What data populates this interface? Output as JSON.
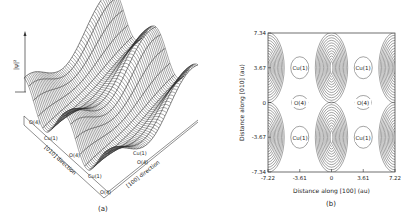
{
  "chart_data": [
    {
      "panel": "a",
      "type": "surface3d",
      "caption": "(a)",
      "zlabel": "|ψ|²",
      "axis_labels": {
        "left_axis": "[010] direction",
        "right_axis": "[100] direction"
      },
      "left_axis_sites": [
        "O(4)",
        "Cu(1)",
        "O(4)",
        "Cu(1)",
        "O(4)"
      ],
      "right_axis_sites": [
        "Cu(1)",
        "O(4)"
      ],
      "description": "Wireframe surface of |ψ|² over the CuO chain plane; ridges along [010] with peaks between Cu(1) sites"
    },
    {
      "panel": "b",
      "type": "contour",
      "caption": "(b)",
      "xlabel": "Distance along [100] (au)",
      "ylabel": "Distance along [010] (au)",
      "xticks": [
        "-7.22",
        "-3.61",
        "0",
        "3.61",
        "7.22"
      ],
      "yticks": [
        "7.34",
        "3.67",
        "0",
        "-3.67",
        "-7.34"
      ],
      "xlim": [
        -7.22,
        7.22
      ],
      "ylim": [
        -7.34,
        7.34
      ],
      "site_labels": [
        {
          "label": "Cu(1)",
          "x": -3.61,
          "y": 3.67
        },
        {
          "label": "Cu(1)",
          "x": 3.61,
          "y": 3.67
        },
        {
          "label": "O(4)",
          "x": -3.61,
          "y": 0
        },
        {
          "label": "O(4)",
          "x": 3.61,
          "y": 0
        },
        {
          "label": "Cu(1)",
          "x": -3.61,
          "y": -3.67
        },
        {
          "label": "Cu(1)",
          "x": 3.61,
          "y": -3.67
        }
      ],
      "maxima_centers": [
        {
          "x": 0,
          "y": 3.67
        },
        {
          "x": 0,
          "y": -3.67
        }
      ],
      "grid": false
    }
  ],
  "panel_a": {
    "zlabel": "|ψ|²",
    "caption": "(a)",
    "dir010": "[010] direction",
    "dir100": "[100] direction",
    "sites_left": [
      "O(4)",
      "Cu(1)",
      "O(4)",
      "Cu(1)",
      "O(4)"
    ],
    "sites_right": [
      "Cu(1)",
      "O(4)"
    ]
  },
  "panel_b": {
    "caption": "(b)",
    "xlabel": "Distance along [100] (au)",
    "ylabel": "Distance along [010] (au)",
    "xticks": [
      "-7.22",
      "-3.61",
      "0",
      "3.61",
      "7.22"
    ],
    "yticks": [
      "7.34",
      "3.67",
      "0",
      "-3.67",
      "-7.34"
    ],
    "labels": [
      "Cu(1)",
      "Cu(1)",
      "O(4)",
      "O(4)",
      "Cu(1)",
      "Cu(1)"
    ]
  }
}
